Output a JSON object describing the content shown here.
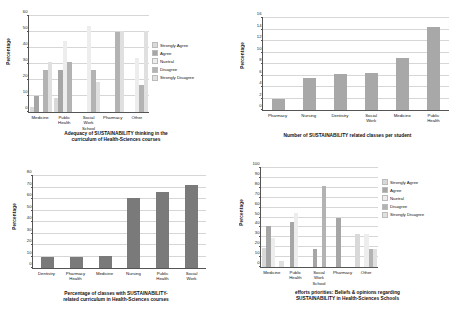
{
  "legend_labels": [
    "Strongly Agree",
    "Agree",
    "Nuetral",
    "Disagree",
    "Strongly Disagree"
  ],
  "legend_colors": [
    "#d9d9d9",
    "#a6a6a6",
    "#ededed",
    "#b3b3b3",
    "#e0e0e0"
  ],
  "axis_label_percentage": "Percentage",
  "chart_data": [
    {
      "id": "chart1",
      "type": "bar",
      "title": "Adequacy of SUSTAINABILITY thinking  in the\ncurriculum of Health-Sciences courses",
      "xlabel": "",
      "ylabel": "Percentage",
      "ylim": [
        0,
        60
      ],
      "yticks": [
        0,
        10,
        20,
        30,
        40,
        50,
        60
      ],
      "grid": true,
      "legend": "right",
      "categories": [
        "Medicine",
        "Public\nHealth",
        "Social\nWork\nSchool",
        "Pharmacy",
        "Other"
      ],
      "series": [
        {
          "name": "Strongly Agree",
          "color": "#d9d9d9",
          "values": [
            3,
            9,
            0,
            0,
            0
          ]
        },
        {
          "name": "Agree",
          "color": "#a6a6a6",
          "values": [
            10,
            26.5,
            0,
            0,
            0
          ]
        },
        {
          "name": "Nuetral",
          "color": "#ededed",
          "values": [
            0,
            44.5,
            54,
            0,
            33.5
          ]
        },
        {
          "name": "Disagree",
          "color": "#b3b3b3",
          "values": [
            26.5,
            31,
            26.5,
            50,
            17
          ]
        },
        {
          "name": "Strongly Disagree",
          "color": "#e0e0e0",
          "values": [
            31,
            0,
            18.5,
            50.5,
            50.5
          ]
        }
      ]
    },
    {
      "id": "chart2",
      "type": "bar",
      "title": "Number of SUSTAINABILITY related classes per student",
      "xlabel": "",
      "ylabel": "Percentage",
      "ylim": [
        0,
        16
      ],
      "yticks": [
        0,
        2,
        4,
        6,
        8,
        10,
        12,
        14,
        16
      ],
      "grid": true,
      "legend": "none",
      "categories": [
        "Pharmacy",
        "Nursing",
        "Dentistry",
        "Social\nWork",
        "Medicine",
        "Public\nHealth"
      ],
      "values": [
        1.9,
        5.5,
        6.3,
        6.5,
        9.0,
        14.4
      ],
      "color": "#a8a8a8"
    },
    {
      "id": "chart3",
      "type": "bar",
      "title": "Percentage of classes with SUSTAINABILITY-\nrelated curriculum  in Health-Sciences courses",
      "xlabel": "",
      "ylabel": "Percentage",
      "ylim": [
        0,
        80
      ],
      "yticks": [
        0,
        10,
        20,
        30,
        40,
        50,
        60,
        70,
        80
      ],
      "grid": true,
      "legend": "none",
      "categories": [
        "Dentistry",
        "Pharmacy\nHealth",
        "Medicine",
        "Nursing",
        "Public\nHealth",
        "Social\nWork"
      ],
      "values": [
        9.5,
        9.5,
        10.5,
        61,
        66.5,
        72
      ],
      "color": "#7a7a7a"
    },
    {
      "id": "chart4",
      "type": "bar",
      "title": "efforts priorities: Beliefs & opinions regarding\nSUSTAINABILITY in Health-Sciences Schools",
      "xlabel": "",
      "ylabel": "Percentage",
      "ylim": [
        0,
        100
      ],
      "yticks": [
        0,
        10,
        20,
        30,
        40,
        50,
        60,
        70,
        80,
        90,
        100
      ],
      "grid": true,
      "legend": "right",
      "categories": [
        "Medicine",
        "Public\nHealth",
        "Social\nWork\nSchool",
        "Pharmacy",
        "Other"
      ],
      "series": [
        {
          "name": "Strongly Agree",
          "color": "#d9d9d9",
          "values": [
            19,
            0,
            0,
            0,
            33
          ]
        },
        {
          "name": "Agree",
          "color": "#a6a6a6",
          "values": [
            41,
            45,
            18,
            50,
            0
          ]
        },
        {
          "name": "Nuetral",
          "color": "#ededed",
          "values": [
            29,
            54.5,
            0,
            0,
            33
          ]
        },
        {
          "name": "Disagree",
          "color": "#b3b3b3",
          "values": [
            0,
            0,
            81.5,
            0,
            18
          ]
        },
        {
          "name": "Strongly Disagree",
          "color": "#e0e0e0",
          "values": [
            6.5,
            0,
            0,
            0,
            18
          ]
        }
      ]
    }
  ]
}
